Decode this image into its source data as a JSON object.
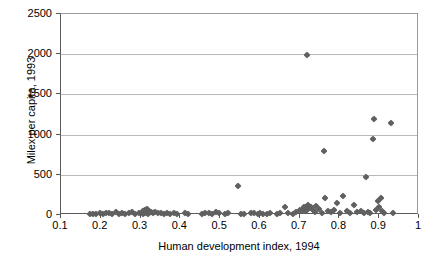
{
  "chart_data": {
    "type": "scatter",
    "title": "",
    "xlabel": "Human development index, 1994",
    "ylabel": "Milex per capita, 1993",
    "xlim": [
      0.1,
      1.0
    ],
    "ylim": [
      0,
      2500
    ],
    "xticks": [
      "0.1",
      "0.2",
      "0.3",
      "0.4",
      "0.5",
      "0.6",
      "0.7",
      "0.8",
      "0.9",
      "1"
    ],
    "xtick_values": [
      0.1,
      0.2,
      0.3,
      0.4,
      0.5,
      0.6,
      0.7,
      0.8,
      0.9,
      1.0
    ],
    "yticks": [
      "0",
      "500",
      "1000",
      "1500",
      "2000",
      "2500"
    ],
    "ytick_values": [
      0,
      500,
      1000,
      1500,
      2000,
      2500
    ],
    "grid": "horizontal",
    "legend": "none",
    "marker": "diamond",
    "marker_color": "#606060",
    "series": [
      {
        "name": "countries",
        "points": [
          [
            0.172,
            10
          ],
          [
            0.181,
            18
          ],
          [
            0.189,
            12
          ],
          [
            0.197,
            22
          ],
          [
            0.206,
            15
          ],
          [
            0.213,
            30
          ],
          [
            0.221,
            20
          ],
          [
            0.229,
            12
          ],
          [
            0.238,
            35
          ],
          [
            0.246,
            18
          ],
          [
            0.254,
            25
          ],
          [
            0.262,
            14
          ],
          [
            0.271,
            20
          ],
          [
            0.279,
            32
          ],
          [
            0.287,
            16
          ],
          [
            0.296,
            24
          ],
          [
            0.305,
            12
          ],
          [
            0.312,
            30
          ],
          [
            0.318,
            18
          ],
          [
            0.305,
            48
          ],
          [
            0.311,
            62
          ],
          [
            0.316,
            75
          ],
          [
            0.32,
            55
          ],
          [
            0.325,
            40
          ],
          [
            0.331,
            28
          ],
          [
            0.337,
            35
          ],
          [
            0.343,
            22
          ],
          [
            0.351,
            30
          ],
          [
            0.358,
            18
          ],
          [
            0.366,
            26
          ],
          [
            0.374,
            15
          ],
          [
            0.383,
            20
          ],
          [
            0.392,
            12
          ],
          [
            0.412,
            26
          ],
          [
            0.42,
            14
          ],
          [
            0.455,
            18
          ],
          [
            0.463,
            30
          ],
          [
            0.471,
            22
          ],
          [
            0.48,
            16
          ],
          [
            0.489,
            38
          ],
          [
            0.497,
            20
          ],
          [
            0.512,
            14
          ],
          [
            0.52,
            28
          ],
          [
            0.545,
            360
          ],
          [
            0.552,
            18
          ],
          [
            0.56,
            12
          ],
          [
            0.578,
            22
          ],
          [
            0.586,
            30
          ],
          [
            0.594,
            16
          ],
          [
            0.601,
            24
          ],
          [
            0.609,
            18
          ],
          [
            0.617,
            12
          ],
          [
            0.626,
            20
          ],
          [
            0.643,
            14
          ],
          [
            0.651,
            22
          ],
          [
            0.663,
            95
          ],
          [
            0.671,
            30
          ],
          [
            0.684,
            18
          ],
          [
            0.692,
            40
          ],
          [
            0.7,
            60
          ],
          [
            0.705,
            45
          ],
          [
            0.71,
            80
          ],
          [
            0.715,
            55
          ],
          [
            0.72,
            70
          ],
          [
            0.712,
            100
          ],
          [
            0.722,
            130
          ],
          [
            0.728,
            95
          ],
          [
            0.733,
            60
          ],
          [
            0.738,
            40
          ],
          [
            0.742,
            110
          ],
          [
            0.748,
            75
          ],
          [
            0.718,
            1990
          ],
          [
            0.757,
            28
          ],
          [
            0.764,
            210
          ],
          [
            0.771,
            55
          ],
          [
            0.779,
            40
          ],
          [
            0.786,
            62
          ],
          [
            0.793,
            155
          ],
          [
            0.762,
            800
          ],
          [
            0.802,
            30
          ],
          [
            0.81,
            240
          ],
          [
            0.818,
            48
          ],
          [
            0.827,
            20
          ],
          [
            0.836,
            130
          ],
          [
            0.845,
            35
          ],
          [
            0.853,
            55
          ],
          [
            0.861,
            28
          ],
          [
            0.868,
            470
          ],
          [
            0.872,
            40
          ],
          [
            0.878,
            20
          ],
          [
            0.885,
            950
          ],
          [
            0.888,
            1200
          ],
          [
            0.892,
            60
          ],
          [
            0.896,
            175
          ],
          [
            0.9,
            95
          ],
          [
            0.905,
            210
          ],
          [
            0.908,
            45
          ],
          [
            0.912,
            25
          ],
          [
            0.93,
            1150
          ],
          [
            0.935,
            30
          ]
        ]
      }
    ]
  }
}
